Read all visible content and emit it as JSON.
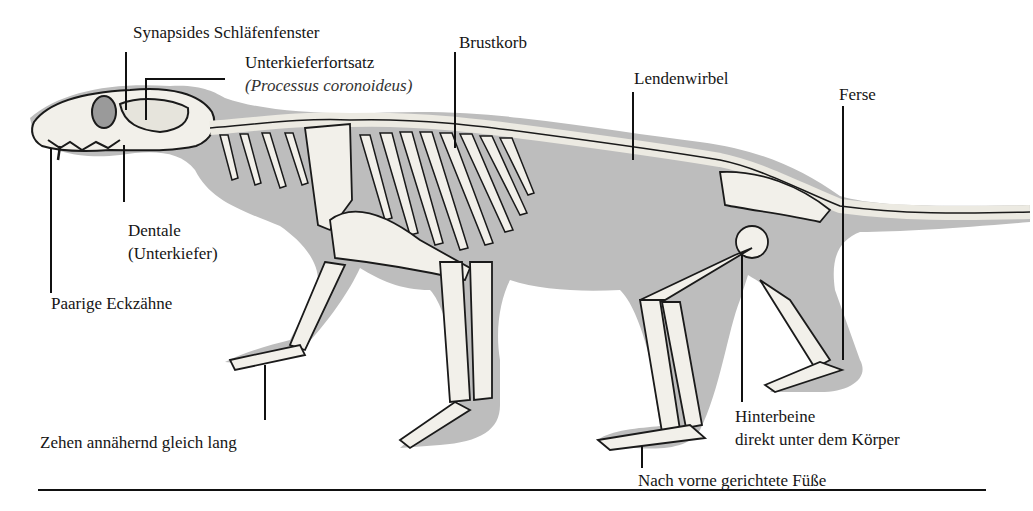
{
  "diagram": {
    "colors": {
      "silhouette": "#bdbdbd",
      "bone": "#f2f0ea",
      "outline": "#1a1a1a",
      "background": "#ffffff",
      "text": "#151515"
    },
    "labels": {
      "synapsid_window": "Synapsides Schläfenfenster",
      "coronoid": "Unterkieferfortsatz",
      "coronoid_latin": "(Processus coronoideus)",
      "ribcage": "Brustkorb",
      "lumbar": "Lendenwirbel",
      "heel": "Ferse",
      "dentary": "Dentale",
      "dentary_sub": "(Unterkiefer)",
      "canines": "Paarige Eckzähne",
      "toes": "Zehen annähernd gleich lang",
      "hindlegs": "Hinterbeine",
      "hindlegs_sub": "direkt unter dem Körper",
      "feet": "Nach vorne gerichtete Füße"
    }
  }
}
